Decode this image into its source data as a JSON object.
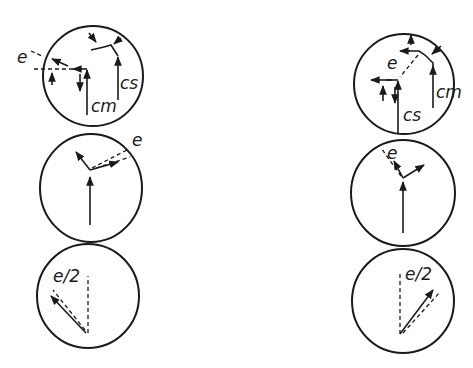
{
  "figure": {
    "type": "vector diagram",
    "columns": [
      {
        "side": "left",
        "panels": [
          {
            "labels": {
              "e": "e",
              "cm": "cm",
              "cs": "cs"
            }
          },
          {
            "labels": {
              "e": "e"
            }
          },
          {
            "labels": {
              "e_half": "e/2"
            }
          }
        ]
      },
      {
        "side": "right",
        "panels": [
          {
            "labels": {
              "e": "e",
              "cm": "cm",
              "cs": "cs"
            }
          },
          {
            "labels": {
              "e": "e"
            }
          },
          {
            "labels": {
              "e_half": "e/2"
            }
          }
        ]
      }
    ]
  },
  "colors": {
    "ink": "#1a1a1a",
    "background": "#ffffff"
  }
}
